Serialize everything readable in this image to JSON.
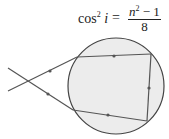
{
  "equation": {
    "lhs_func": "cos",
    "lhs_exp": "2",
    "lhs_var": "i",
    "equals": "=",
    "num_var": "n",
    "num_exp": "2",
    "num_rest": " − 1",
    "den": "8"
  },
  "diagram": {
    "circle_fill": "#ececec",
    "stroke": "#444444"
  }
}
